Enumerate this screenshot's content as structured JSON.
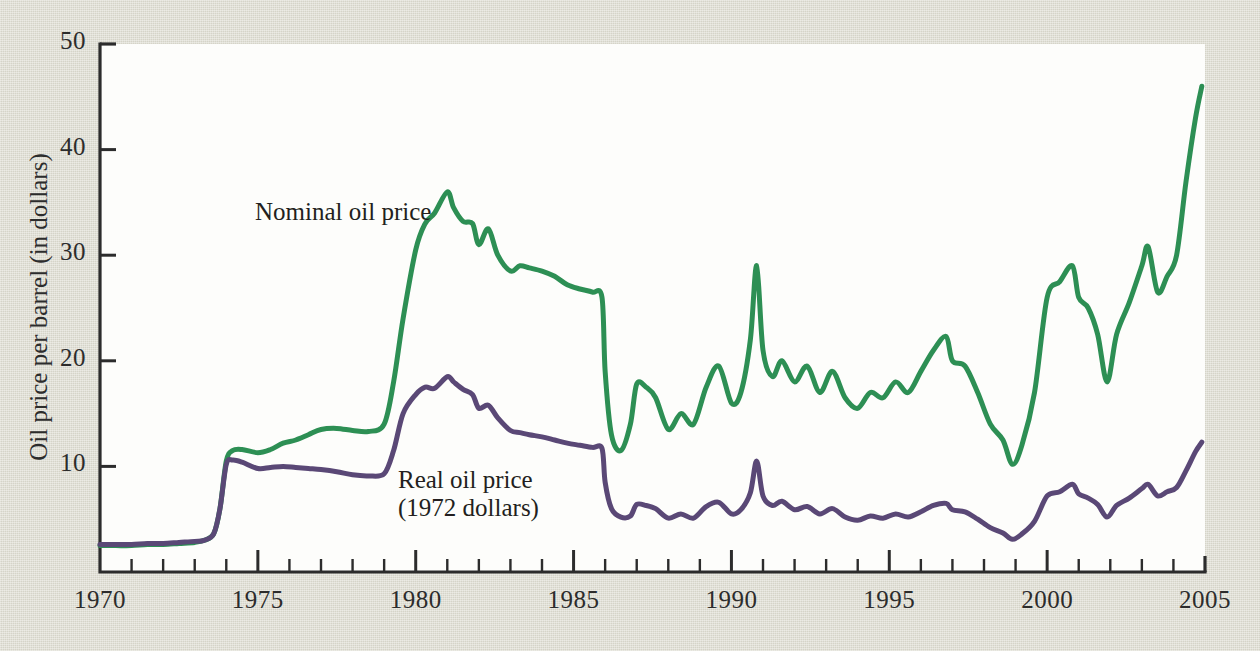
{
  "figure": {
    "background_color": "#dcdbcf",
    "plot_background_color": "#fdfdfb",
    "axis_color": "#2c2c2c"
  },
  "chart_data": {
    "type": "line",
    "title": "",
    "xlabel": "",
    "ylabel": "Oil price per barrel (in dollars)",
    "xlim": [
      1970,
      2005
    ],
    "ylim": [
      0,
      50
    ],
    "grid": false,
    "legend": "inline-annotations",
    "x_ticks_major": [
      "1970",
      "1975",
      "1980",
      "1985",
      "1990",
      "1995",
      "2000",
      "2005"
    ],
    "x_ticks_major_values": [
      1970,
      1975,
      1980,
      1985,
      1990,
      1995,
      2000,
      2005
    ],
    "x_minor_tick_step": 1,
    "y_ticks": [
      "10",
      "20",
      "30",
      "40",
      "50"
    ],
    "y_tick_values": [
      10,
      20,
      30,
      40,
      50
    ],
    "series": [
      {
        "name": "Nominal oil price",
        "color": "#2d8f54",
        "annotation": "Nominal oil price",
        "x": [
          1970.0,
          1970.5,
          1971.0,
          1971.5,
          1972.0,
          1972.5,
          1973.0,
          1973.3,
          1973.6,
          1973.8,
          1974.0,
          1974.2,
          1974.5,
          1975.0,
          1975.4,
          1975.8,
          1976.2,
          1976.6,
          1977.0,
          1977.5,
          1978.0,
          1978.5,
          1979.0,
          1979.3,
          1979.6,
          1980.0,
          1980.3,
          1980.6,
          1981.0,
          1981.2,
          1981.5,
          1981.8,
          1982.0,
          1982.3,
          1982.6,
          1983.0,
          1983.3,
          1983.6,
          1984.0,
          1984.4,
          1984.8,
          1985.2,
          1985.6,
          1985.9,
          1986.0,
          1986.2,
          1986.5,
          1986.8,
          1987.0,
          1987.3,
          1987.6,
          1988.0,
          1988.4,
          1988.8,
          1989.2,
          1989.6,
          1990.0,
          1990.3,
          1990.6,
          1990.8,
          1991.0,
          1991.3,
          1991.6,
          1992.0,
          1992.4,
          1992.8,
          1993.2,
          1993.6,
          1994.0,
          1994.4,
          1994.8,
          1995.2,
          1995.6,
          1996.0,
          1996.4,
          1996.8,
          1997.0,
          1997.4,
          1997.8,
          1998.2,
          1998.6,
          1998.9,
          1999.2,
          1999.6,
          2000.0,
          2000.4,
          2000.8,
          2001.0,
          2001.3,
          2001.6,
          2001.9,
          2002.2,
          2002.6,
          2003.0,
          2003.2,
          2003.5,
          2003.8,
          2004.1,
          2004.4,
          2004.7,
          2004.9
        ],
        "y": [
          2.5,
          2.5,
          2.5,
          2.6,
          2.6,
          2.7,
          2.8,
          3.0,
          3.6,
          6.0,
          10.5,
          11.5,
          11.6,
          11.3,
          11.6,
          12.2,
          12.5,
          13.0,
          13.5,
          13.6,
          13.4,
          13.3,
          14.0,
          18.0,
          24.0,
          30.5,
          33.0,
          34.0,
          36.0,
          34.5,
          33.2,
          33.0,
          31.0,
          32.5,
          30.0,
          28.5,
          29.0,
          28.8,
          28.5,
          28.0,
          27.2,
          26.8,
          26.5,
          26.0,
          19.0,
          13.0,
          11.5,
          14.0,
          17.8,
          17.5,
          16.5,
          13.5,
          15.0,
          14.0,
          17.5,
          19.5,
          16.0,
          17.0,
          22.0,
          29.0,
          21.0,
          18.5,
          20.0,
          18.0,
          19.5,
          17.0,
          19.0,
          16.5,
          15.5,
          17.0,
          16.5,
          18.0,
          17.0,
          19.0,
          21.0,
          22.3,
          20.0,
          19.5,
          17.0,
          14.0,
          12.5,
          10.2,
          12.0,
          17.0,
          26.0,
          27.5,
          29.0,
          26.0,
          25.0,
          22.5,
          18.0,
          22.5,
          25.5,
          29.0,
          30.8,
          26.5,
          28.0,
          30.0,
          37.0,
          43.0,
          46.0
        ]
      },
      {
        "name": "Real oil price (1972 dollars)",
        "color": "#5a4876",
        "annotation": "Real oil price\n(1972 dollars)",
        "x": [
          1970.0,
          1970.5,
          1971.0,
          1971.5,
          1972.0,
          1972.5,
          1973.0,
          1973.3,
          1973.6,
          1973.8,
          1974.0,
          1974.2,
          1974.5,
          1975.0,
          1975.4,
          1975.8,
          1976.2,
          1976.6,
          1977.0,
          1977.5,
          1978.0,
          1978.5,
          1979.0,
          1979.3,
          1979.6,
          1980.0,
          1980.3,
          1980.6,
          1981.0,
          1981.2,
          1981.5,
          1981.8,
          1982.0,
          1982.3,
          1982.6,
          1983.0,
          1983.3,
          1983.6,
          1984.0,
          1984.4,
          1984.8,
          1985.2,
          1985.6,
          1985.9,
          1986.0,
          1986.2,
          1986.5,
          1986.8,
          1987.0,
          1987.3,
          1987.6,
          1988.0,
          1988.4,
          1988.8,
          1989.2,
          1989.6,
          1990.0,
          1990.3,
          1990.6,
          1990.8,
          1991.0,
          1991.3,
          1991.6,
          1992.0,
          1992.4,
          1992.8,
          1993.2,
          1993.6,
          1994.0,
          1994.4,
          1994.8,
          1995.2,
          1995.6,
          1996.0,
          1996.4,
          1996.8,
          1997.0,
          1997.4,
          1997.8,
          1998.2,
          1998.6,
          1998.9,
          1999.2,
          1999.6,
          2000.0,
          2000.4,
          2000.8,
          2001.0,
          2001.3,
          2001.6,
          2001.9,
          2002.2,
          2002.6,
          2003.0,
          2003.2,
          2003.5,
          2003.8,
          2004.1,
          2004.4,
          2004.7,
          2004.9
        ],
        "y": [
          2.6,
          2.6,
          2.6,
          2.7,
          2.7,
          2.8,
          2.9,
          3.0,
          3.6,
          6.0,
          10.2,
          10.6,
          10.4,
          9.8,
          9.9,
          10.0,
          9.9,
          9.8,
          9.7,
          9.5,
          9.2,
          9.1,
          9.3,
          11.5,
          15.0,
          16.8,
          17.5,
          17.4,
          18.5,
          18.0,
          17.3,
          16.8,
          15.5,
          15.8,
          14.6,
          13.4,
          13.2,
          13.0,
          12.8,
          12.5,
          12.2,
          12.0,
          11.8,
          11.7,
          8.5,
          6.0,
          5.2,
          5.3,
          6.4,
          6.3,
          6.0,
          5.1,
          5.5,
          5.1,
          6.2,
          6.6,
          5.5,
          5.9,
          7.5,
          10.5,
          7.2,
          6.3,
          6.7,
          5.9,
          6.2,
          5.5,
          6.0,
          5.2,
          4.9,
          5.3,
          5.1,
          5.5,
          5.2,
          5.7,
          6.3,
          6.5,
          5.9,
          5.7,
          5.0,
          4.2,
          3.7,
          3.1,
          3.6,
          4.8,
          7.2,
          7.6,
          8.3,
          7.4,
          7.0,
          6.4,
          5.2,
          6.3,
          7.0,
          7.9,
          8.3,
          7.2,
          7.6,
          8.0,
          9.6,
          11.4,
          12.3
        ]
      }
    ]
  },
  "axes": {
    "y_title": "Oil price per barrel (in dollars)"
  }
}
